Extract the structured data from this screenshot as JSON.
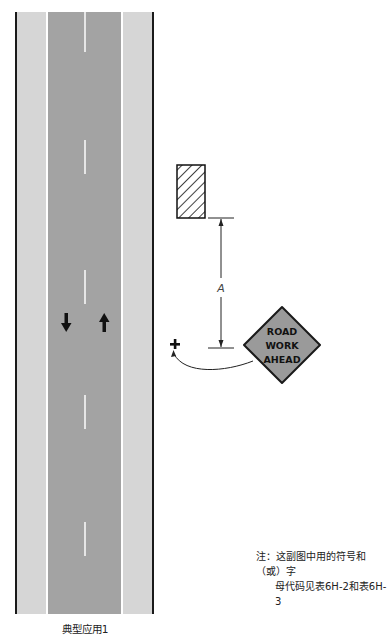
{
  "diagram": {
    "title": "典型应用1",
    "road": {
      "lanes": 2,
      "directions": [
        "down",
        "up"
      ],
      "colors": {
        "pavement": "#a3a3a3",
        "shoulder": "#d6d6d6",
        "edge_line": "#ffffff",
        "center_dash": "#e4e4e4",
        "outer_edge": "#1a1a1a"
      }
    },
    "work_area_symbol": "hatched-rectangle",
    "dimension_label": "A",
    "sign": {
      "lines": [
        "ROAD",
        "WORK",
        "AHEAD"
      ],
      "shape": "diamond",
      "color": "#9a9a9a"
    },
    "sign_position_marker": "plus-symbol",
    "note": {
      "line1": "注：这副图中用的符号和（或）字",
      "line2": "母代码见表6H-2和表6H-3"
    }
  }
}
